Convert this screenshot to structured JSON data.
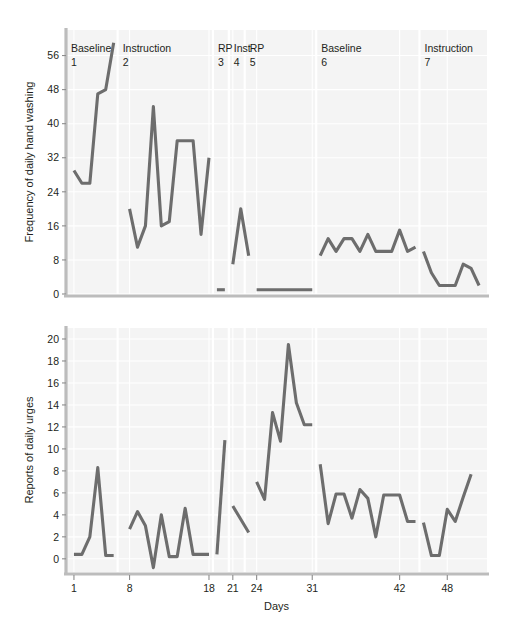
{
  "figure": {
    "background_color": "#ffffff",
    "plot_background_color": "#f4f4f4",
    "line_color": "#6d6d6d",
    "grid_color": "#ffffff",
    "axis_color": "#bcbcbc"
  },
  "phases": [
    {
      "name": "Baseline",
      "number": "1"
    },
    {
      "name": "Instruction",
      "number": "2"
    },
    {
      "name": "RP",
      "number": "3"
    },
    {
      "name": "Inst",
      "number": "4"
    },
    {
      "name": "RP",
      "number": "5"
    },
    {
      "name": "Baseline",
      "number": "6"
    },
    {
      "name": "Instruction",
      "number": "7"
    }
  ],
  "chart_data": [
    {
      "id": "hand-washing",
      "type": "line",
      "title": "",
      "xlabel": "",
      "ylabel": "Frequency of daily hand washing",
      "ylim": [
        0,
        62
      ],
      "yticks": [
        0,
        8,
        16,
        24,
        32,
        40,
        48,
        56
      ],
      "xlim": [
        0,
        53
      ],
      "xticks": [
        1,
        8,
        18,
        21,
        24,
        31,
        42,
        48
      ],
      "grid": true,
      "phase_boundaries": [
        6.5,
        18.5,
        20.5,
        22.5,
        31.5,
        44.5
      ],
      "phase_labels": [
        "Baseline 1",
        "Instruction 2",
        "RP 3",
        "Inst 4",
        "RP 5",
        "Baseline 6",
        "Instruction 7"
      ],
      "series": [
        {
          "name": "Baseline 1",
          "x": [
            1,
            2,
            3,
            4,
            5,
            6
          ],
          "values": [
            29,
            26,
            26,
            47,
            48,
            59
          ]
        },
        {
          "name": "Instruction 2",
          "x": [
            8,
            9,
            10,
            11,
            12,
            13,
            14,
            15,
            16,
            17,
            18
          ],
          "values": [
            20,
            11,
            16,
            44,
            16,
            17,
            36,
            36,
            36,
            14,
            32
          ]
        },
        {
          "name": "RP 3",
          "x": [
            19,
            20
          ],
          "values": [
            1,
            1
          ]
        },
        {
          "name": "Inst 4",
          "x": [
            21,
            22,
            23
          ],
          "values": [
            7,
            20,
            9
          ]
        },
        {
          "name": "RP 5",
          "x": [
            24,
            25,
            26,
            27,
            28,
            29,
            30,
            31
          ],
          "values": [
            1,
            1,
            1,
            1,
            1,
            1,
            1,
            1
          ]
        },
        {
          "name": "Baseline 6",
          "x": [
            32,
            33,
            34,
            35,
            36,
            37,
            38,
            39,
            40,
            41,
            42,
            43,
            44
          ],
          "values": [
            9,
            13,
            10,
            13,
            13,
            10,
            14,
            10,
            10,
            10,
            15,
            10,
            11
          ]
        },
        {
          "name": "Instruction 7",
          "x": [
            45,
            46,
            47,
            48,
            49,
            50,
            51,
            52
          ],
          "values": [
            10,
            5,
            2,
            2,
            2,
            7,
            6,
            2
          ]
        }
      ]
    },
    {
      "id": "daily-urges",
      "type": "line",
      "title": "",
      "xlabel": "Days",
      "ylabel": "Reports of daily urges",
      "ylim": [
        -1.2,
        21
      ],
      "yticks": [
        0,
        2,
        4,
        6,
        8,
        10,
        12,
        14,
        16,
        18,
        20
      ],
      "xlim": [
        0,
        53
      ],
      "xticks": [
        1,
        8,
        18,
        21,
        24,
        31,
        42,
        48
      ],
      "grid": true,
      "phase_boundaries": [
        6.5,
        18.5,
        20.5,
        22.5,
        31.5,
        44.5
      ],
      "series": [
        {
          "name": "Baseline 1",
          "x": [
            1,
            2,
            3,
            4,
            5,
            6
          ],
          "values": [
            0.4,
            0.4,
            2,
            8.3,
            0.3,
            0.3
          ]
        },
        {
          "name": "Instruction 2",
          "x": [
            8,
            9,
            10,
            11,
            12,
            13,
            14,
            15,
            16,
            17,
            18
          ],
          "values": [
            2.7,
            4.3,
            3,
            -0.8,
            4,
            0.2,
            0.2,
            4.6,
            0.4,
            0.4,
            0.4
          ]
        },
        {
          "name": "RP 3",
          "x": [
            19,
            20
          ],
          "values": [
            0.4,
            10.8
          ]
        },
        {
          "name": "Inst 4",
          "x": [
            21,
            22,
            23
          ],
          "values": [
            4.8,
            3.6,
            2.4
          ]
        },
        {
          "name": "RP 5",
          "x": [
            24,
            25,
            26,
            27,
            28,
            29,
            30,
            31
          ],
          "values": [
            7,
            5.4,
            13.3,
            10.7,
            19.5,
            14.2,
            12.2,
            12.2
          ]
        },
        {
          "name": "Baseline 6",
          "x": [
            32,
            33,
            34,
            35,
            36,
            37,
            38,
            39,
            40,
            41,
            42,
            43,
            44
          ],
          "values": [
            8.6,
            3.2,
            5.9,
            5.9,
            3.7,
            6.3,
            5.5,
            2,
            5.8,
            5.8,
            5.8,
            3.4,
            3.4
          ]
        },
        {
          "name": "Instruction 7",
          "x": [
            45,
            46,
            47,
            48,
            49,
            50,
            51
          ],
          "values": [
            3.3,
            0.3,
            0.3,
            4.5,
            3.4,
            5.6,
            7.7
          ]
        }
      ]
    }
  ]
}
